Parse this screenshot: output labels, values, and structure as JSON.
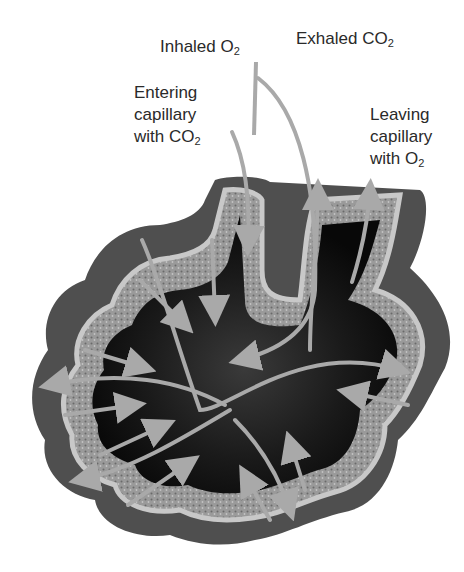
{
  "diagram": {
    "labels": {
      "inhaled": {
        "text": "Inhaled O",
        "sub": "2"
      },
      "exhaled": {
        "text": "Exhaled CO",
        "sub": "2"
      },
      "entering": {
        "line1": "Entering",
        "line2": "capillary",
        "line3": "with CO",
        "sub": "2"
      },
      "leaving": {
        "line1": "Leaving",
        "line2": "capillary",
        "line3": "with O",
        "sub": "2"
      }
    },
    "colors": {
      "arrow": "#a9a9a9",
      "outer_tissue": "#5a5a5a",
      "capillary_band": "#b8b8b8",
      "lumen": "#141414",
      "text": "#2a2a2a"
    }
  }
}
